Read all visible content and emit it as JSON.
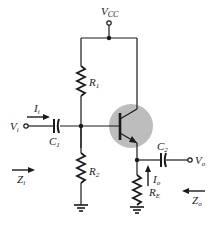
{
  "diagram": {
    "type": "circuit-schematic",
    "labels": {
      "vcc": {
        "main": "V",
        "sub": "CC"
      },
      "r1": {
        "main": "R",
        "sub": "1"
      },
      "r2": {
        "main": "R",
        "sub": "2"
      },
      "re": {
        "main": "R",
        "sub": "E"
      },
      "c1": {
        "main": "C",
        "sub": "1"
      },
      "c2": {
        "main": "C",
        "sub": "2"
      },
      "vi": {
        "main": "V",
        "sub": "i"
      },
      "vo": {
        "main": "V",
        "sub": "o"
      },
      "ii": {
        "main": "I",
        "sub": "i"
      },
      "io": {
        "main": "I",
        "sub": "o"
      },
      "zi": {
        "main": "Z",
        "sub": "i"
      },
      "zo": {
        "main": "Z",
        "sub": "o"
      }
    },
    "colors": {
      "wire": "#1a1a1a",
      "transistor_highlight": "#bdbdbd",
      "background": "#ffffff"
    }
  }
}
